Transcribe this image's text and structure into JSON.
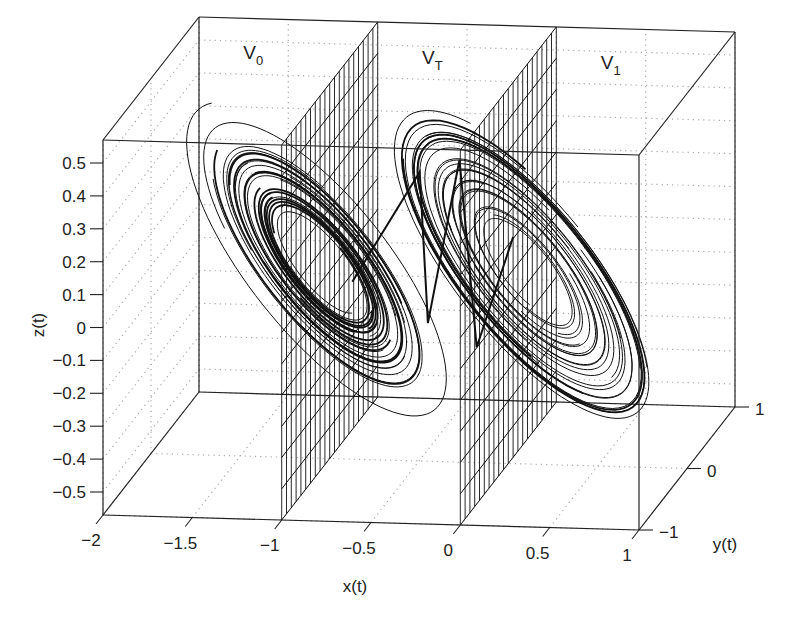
{
  "chart_data": {
    "type": "line3d",
    "title": "",
    "xlabel": "x(t)",
    "ylabel": "y(t)",
    "zlabel": "z(t)",
    "xlim": [
      -2,
      1
    ],
    "ylim": [
      -1,
      1
    ],
    "zlim": [
      -0.57,
      0.57
    ],
    "x_ticks": [
      "-2",
      "-1.5",
      "-1",
      "-0.5",
      "0",
      "0.5",
      "1"
    ],
    "x_tick_values": [
      -2,
      -1.5,
      -1,
      -0.5,
      0,
      0.5,
      1
    ],
    "y_ticks": [
      "-1",
      "0",
      "1"
    ],
    "y_tick_values": [
      -1,
      0,
      1
    ],
    "z_ticks": [
      "0.5",
      "0.4",
      "0.3",
      "0.2",
      "0.1",
      "0",
      "-0.1",
      "-0.2",
      "-0.3",
      "-0.4",
      "-0.5"
    ],
    "z_tick_values": [
      0.5,
      0.4,
      0.3,
      0.2,
      0.1,
      0,
      -0.1,
      -0.2,
      -0.3,
      -0.4,
      -0.5
    ],
    "grid": true,
    "planes": [
      {
        "name": "boundary-plane-x-minus-1",
        "x": -1
      },
      {
        "name": "boundary-plane-x-0",
        "x": 0
      }
    ],
    "region_labels": [
      {
        "main": "V",
        "sub": "0",
        "x": -1.5
      },
      {
        "main": "V",
        "sub": "T",
        "x": -0.5
      },
      {
        "main": "V",
        "sub": "1",
        "x": 0.5
      }
    ],
    "series": [
      {
        "name": "trajectory-scroll-left",
        "center_x": -1.0,
        "description": "chaotic double-scroll trajectory, left scroll centered near x=-1"
      },
      {
        "name": "trajectory-scroll-right",
        "center_x": 0.0,
        "description": "chaotic double-scroll trajectory, right scroll centered near x=0"
      },
      {
        "name": "trajectory-transition",
        "description": "transition segments crossing region V_T between x=-1 and x=0"
      }
    ]
  }
}
